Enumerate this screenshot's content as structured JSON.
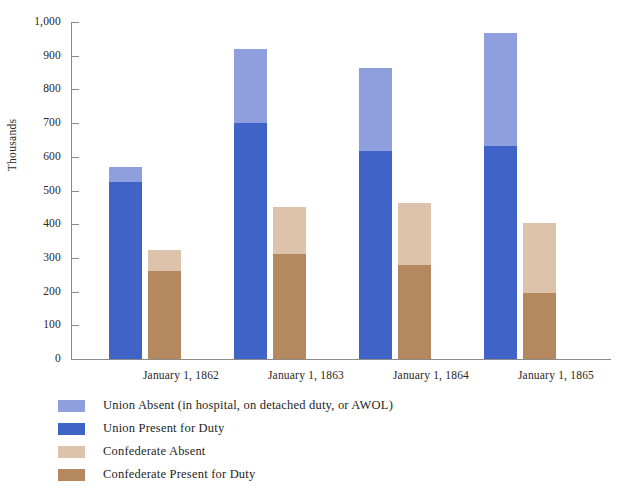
{
  "chart_data": {
    "type": "bar",
    "subtype": "grouped-stacked",
    "title": "",
    "xlabel": "",
    "ylabel": "Thousands",
    "ylim": [
      0,
      1000
    ],
    "ytick_step": 100,
    "ytick_labels": [
      "1,000",
      "900",
      "800",
      "700",
      "600",
      "500",
      "400",
      "300",
      "200",
      "100",
      "0"
    ],
    "ytick_values": [
      1000,
      900,
      800,
      700,
      600,
      500,
      400,
      300,
      200,
      100,
      0
    ],
    "grid": false,
    "legend_position": "below-left",
    "categories": [
      "January 1, 1862",
      "January 1, 1863",
      "January 1, 1864",
      "January 1, 1865"
    ],
    "series": [
      {
        "name": "Union Present for Duty",
        "stack": "Union",
        "color": "#3f63c6",
        "values": [
          525,
          700,
          618,
          632
        ]
      },
      {
        "name": "Union Absent (in hospital, on detached duty, or AWOL)",
        "stack": "Union",
        "color": "#8f9fdd",
        "values": [
          45,
          220,
          247,
          336
        ]
      },
      {
        "name": "Confederate Present for Duty",
        "stack": "Confederate",
        "color": "#b4895f",
        "values": [
          262,
          312,
          278,
          196
        ]
      },
      {
        "name": "Confederate Absent",
        "stack": "Confederate",
        "color": "#ddc3ac",
        "values": [
          63,
          140,
          184,
          209
        ]
      }
    ],
    "stack_totals": {
      "Union": [
        570,
        920,
        865,
        968
      ],
      "Confederate": [
        325,
        452,
        462,
        405
      ]
    }
  },
  "legend": {
    "items": [
      {
        "label": "Union Absent (in hospital, on detached duty, or AWOL)",
        "color": "#8f9fdd"
      },
      {
        "label": "Union Present for Duty",
        "color": "#3f63c6"
      },
      {
        "label": "Confederate Absent",
        "color": "#ddc3ac"
      },
      {
        "label": "Confederate Present for Duty",
        "color": "#b4895f"
      }
    ]
  },
  "axis": {
    "y_title": "Thousands"
  }
}
